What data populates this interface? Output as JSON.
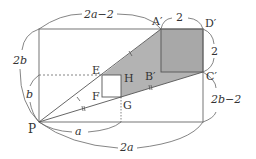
{
  "diagram": {
    "colors": {
      "line": "#555555",
      "shade": "#b3b3b3",
      "text": "#333333",
      "background": "#ffffff"
    },
    "points": {
      "P": "P",
      "A": "A′",
      "D": "D′",
      "C": "C′",
      "B": "B′",
      "E": "E",
      "F": "F",
      "G": "G",
      "H": "H"
    },
    "dimensions": {
      "top": "2a−2",
      "top_square": "2",
      "right_square": "2",
      "right_lower": "2b−2",
      "left_outer": "2b",
      "left_inner": "b",
      "bottom_inner": "a",
      "bottom_outer": "2a"
    }
  }
}
